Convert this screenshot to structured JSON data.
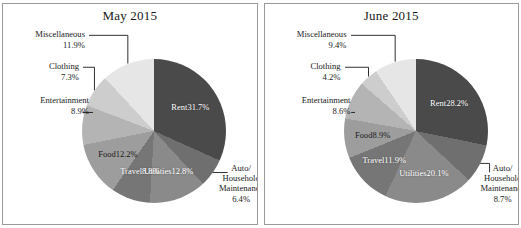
{
  "chart_data": [
    {
      "type": "pie",
      "title": "May 2015",
      "categories": [
        "Rent",
        "Auto/ Household Maintenance",
        "Utilities",
        "Travel",
        "Food",
        "Entertainment",
        "Clothing",
        "Miscellaneous"
      ],
      "values": [
        31.7,
        6.4,
        12.8,
        8.8,
        12.2,
        8.9,
        7.3,
        11.9
      ],
      "value_labels": [
        "31.7%",
        "6.4%",
        "12.8%",
        "8.8%",
        "12.2%",
        "8.9%",
        "7.3%",
        "11.9%"
      ],
      "colors": [
        "#4a4a4a",
        "#6f6f6f",
        "#8a8a8a",
        "#767676",
        "#9d9d9d",
        "#b4b4b4",
        "#cdcdcd",
        "#e6e6e6"
      ],
      "start_angle": 0,
      "direction": "clockwise",
      "legend": "none",
      "grid": false,
      "slices": [
        {
          "name": "Rent",
          "pct": 31.7,
          "label": "Rent",
          "value_label": "31.7%",
          "placement": "inside",
          "text": "light"
        },
        {
          "name": "Auto/ Household Maintenance",
          "pct": 6.4,
          "label": "Auto/\nHousehold\nMaintenance",
          "value_label": "6.4%",
          "placement": "outside-right",
          "text": "dark"
        },
        {
          "name": "Utilities",
          "pct": 12.8,
          "label": "Utilities",
          "value_label": "12.8%",
          "placement": "inside",
          "text": "light"
        },
        {
          "name": "Travel",
          "pct": 8.8,
          "label": "Travel",
          "value_label": "8.8%",
          "placement": "inside",
          "text": "light"
        },
        {
          "name": "Food",
          "pct": 12.2,
          "label": "Food",
          "value_label": "12.2%",
          "placement": "inside",
          "text": "dark"
        },
        {
          "name": "Entertainment",
          "pct": 8.9,
          "label": "Entertainment",
          "value_label": "8.9%",
          "placement": "outside-left",
          "text": "dark"
        },
        {
          "name": "Clothing",
          "pct": 7.3,
          "label": "Clothing",
          "value_label": "7.3%",
          "placement": "outside-left",
          "text": "dark"
        },
        {
          "name": "Miscellaneous",
          "pct": 11.9,
          "label": "Miscellaneous",
          "value_label": "11.9%",
          "placement": "outside-left",
          "text": "dark"
        }
      ]
    },
    {
      "type": "pie",
      "title": "June 2015",
      "categories": [
        "Rent",
        "Auto/ Household Maintenance",
        "Utilities",
        "Travel",
        "Food",
        "Entertainment",
        "Clothing",
        "Miscellaneous"
      ],
      "values": [
        28.2,
        8.7,
        20.1,
        11.9,
        8.9,
        8.6,
        4.2,
        9.4
      ],
      "value_labels": [
        "28.2%",
        "8.7%",
        "20.1%",
        "11.9%",
        "8.9%",
        "8.6%",
        "4.2%",
        "9.4%"
      ],
      "colors": [
        "#4a4a4a",
        "#6f6f6f",
        "#8a8a8a",
        "#767676",
        "#9d9d9d",
        "#b4b4b4",
        "#cdcdcd",
        "#e6e6e6"
      ],
      "start_angle": 0,
      "direction": "clockwise",
      "legend": "none",
      "grid": false,
      "slices": [
        {
          "name": "Rent",
          "pct": 28.2,
          "label": "Rent",
          "value_label": "28.2%",
          "placement": "inside",
          "text": "light"
        },
        {
          "name": "Auto/ Household Maintenance",
          "pct": 8.7,
          "label": "Auto/\nHousehold\nMaintenance",
          "value_label": "8.7%",
          "placement": "outside-right",
          "text": "dark"
        },
        {
          "name": "Utilities",
          "pct": 20.1,
          "label": "Utilities",
          "value_label": "20.1%",
          "placement": "inside",
          "text": "light"
        },
        {
          "name": "Travel",
          "pct": 11.9,
          "label": "Travel",
          "value_label": "11.9%",
          "placement": "inside",
          "text": "light"
        },
        {
          "name": "Food",
          "pct": 8.9,
          "label": "Food",
          "value_label": "8.9%",
          "placement": "inside",
          "text": "dark"
        },
        {
          "name": "Entertainment",
          "pct": 8.6,
          "label": "Entertainment",
          "value_label": "8.6%",
          "placement": "outside-left",
          "text": "dark"
        },
        {
          "name": "Clothing",
          "pct": 4.2,
          "label": "Clothing",
          "value_label": "4.2%",
          "placement": "outside-left",
          "text": "dark"
        },
        {
          "name": "Miscellaneous",
          "pct": 9.4,
          "label": "Miscellaneous",
          "value_label": "9.4%",
          "placement": "outside-left",
          "text": "dark"
        }
      ]
    }
  ]
}
